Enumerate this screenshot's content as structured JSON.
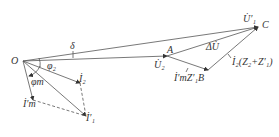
{
  "diagram": {
    "points": {
      "O": {
        "label": "O",
        "x": 23,
        "y": 61
      },
      "A": {
        "label": "A",
        "x": 167,
        "y": 56
      },
      "B": {
        "label": "B",
        "x": 208,
        "y": 70
      },
      "C": {
        "label": "C",
        "x": 258,
        "y": 27
      }
    },
    "labels": {
      "O": "O",
      "A": "A",
      "B": "B",
      "C": "C",
      "delta": "δ",
      "phi2": "φ₂",
      "phim": "φm",
      "U2": "U̇₂",
      "U1p": "U̇′₁",
      "dU": "ΔU̇",
      "I2": "İ₂",
      "Im": "İ′m",
      "I1p": "İ′₁",
      "ImZ1B": "İ′mZ′₁B",
      "I2Z": "İ₂(Z₂+Z′₁)"
    },
    "colors": {
      "line": "#444444",
      "text": "#333333"
    }
  }
}
